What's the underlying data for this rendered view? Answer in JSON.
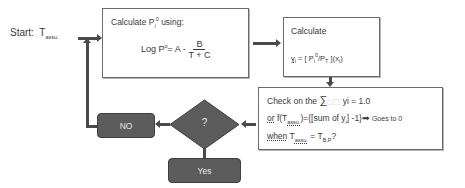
{
  "start": {
    "label": "Start:",
    "var": "T",
    "var_sub": "assu."
  },
  "box1": {
    "title": "Calculate P",
    "title_sub": "i",
    "title_sup": "0",
    "title_rest": " using:",
    "formula_left": "Log P",
    "formula_sup": "o",
    "formula_mid": "= A -",
    "formula_num": "B",
    "formula_den": "T + C"
  },
  "box2": {
    "title": "Calculate",
    "formula_y": "y",
    "formula_y_sub": "i",
    "formula_eq": " = [ P",
    "formula_p_sub": "i",
    "formula_p_sup": "0",
    "formula_mid": "/P",
    "formula_pt_sub": "T",
    "formula_end": " ](x",
    "formula_x_sub": "i",
    "formula_close": ")"
  },
  "box3": {
    "line1_prefix": "Check on the ",
    "line1_sum": "∑",
    "line1_placeholder": "⬚",
    "line1_suffix": " yi = 1.0",
    "line2_or": "or",
    "line2_f": " f(T",
    "line2_f_sub": "assu.",
    "line2_mid": ")={[sum of y",
    "line2_y_sub": "i",
    "line2_end": "] -1}",
    "line2_arrow": "➡",
    "line2_goes": " Goes to 0",
    "line3_when": "when",
    "line3_t": " T",
    "line3_t_sub": "assu.",
    "line3_eq": " = T",
    "line3_bp_sub": "B,P",
    "line3_q": "?"
  },
  "decision": {
    "label": "?"
  },
  "no_box": {
    "label": "NO"
  },
  "yes_box": {
    "label": "Yes"
  },
  "colors": {
    "dark_fill": "#5c5c5c",
    "line": "#4a4a4a",
    "border": "#6b6b6b"
  }
}
